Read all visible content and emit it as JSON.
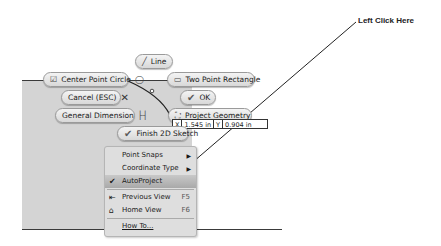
{
  "callout": {
    "text": "Left Click Here"
  },
  "marking_menu": {
    "line": "Line",
    "center_point_circle": "Center Point Circle",
    "two_point_rectangle": "Two Point Rectangle",
    "cancel": "Cancel (ESC)",
    "ok": "OK",
    "general_dimension": "General Dimension",
    "project_geometry": "Project Geometry",
    "finish_2d_sketch": "Finish 2D Sketch"
  },
  "coordinate_input": {
    "x_label": "X",
    "x_value": "1.545 in",
    "y_label": "Y",
    "y_value": "0.904 in"
  },
  "context_menu": {
    "items": [
      {
        "label": "Point Snaps",
        "submenu": true
      },
      {
        "label": "Coordinate Type",
        "submenu": true
      },
      {
        "label": "AutoProject",
        "checked": true
      },
      {
        "label": "Previous View",
        "shortcut": "F5"
      },
      {
        "label": "Home View",
        "shortcut": "F6"
      },
      {
        "label": "How To..."
      }
    ]
  },
  "colors": {
    "sketch_fill": "#d4d4d4",
    "menu_bg": "#dedede",
    "highlight": "#b0b0b0"
  }
}
